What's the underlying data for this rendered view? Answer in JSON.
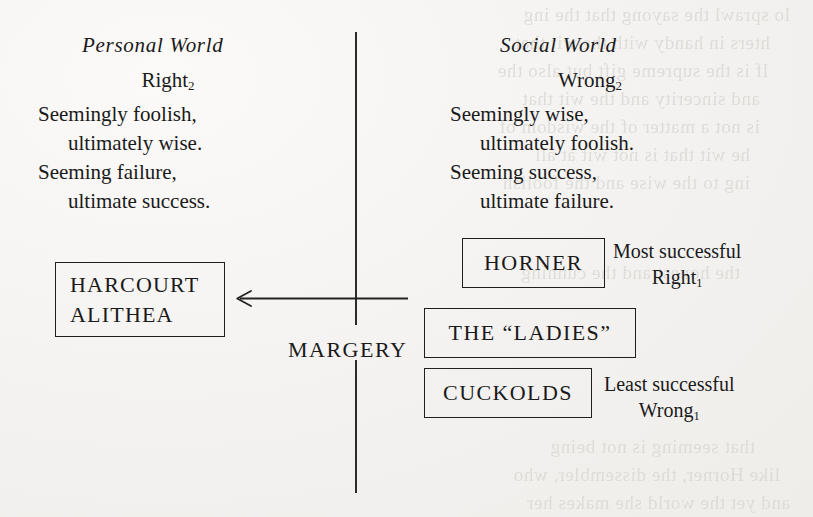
{
  "figure": {
    "background_color": "#f4f3f1",
    "ink_color": "#1f1f1f",
    "columns": {
      "left_heading": "Personal World",
      "right_heading": "Social World"
    },
    "left_stanza": {
      "label": "Right",
      "label_subscript": "2",
      "lines": [
        "Seemingly foolish,",
        "ultimately wise.",
        "Seeming failure,",
        "ultimate success."
      ]
    },
    "right_stanza": {
      "label": "Wrong",
      "label_subscript": "2",
      "lines": [
        "Seemingly wise,",
        "ultimately foolish.",
        "Seeming success,",
        "ultimate failure."
      ]
    },
    "boxes": [
      {
        "id": "harcourt-alithea",
        "line1": "HARCOURT",
        "line2": "ALITHEA"
      },
      {
        "id": "horner",
        "text": "HORNER"
      },
      {
        "id": "the-ladies",
        "text": "THE “LADIES”"
      },
      {
        "id": "cuckolds",
        "text": "CUCKOLDS"
      }
    ],
    "annotations": {
      "top_rank": "Most successful",
      "top_rank_label": "Right",
      "top_rank_subscript": "1",
      "bottom_rank": "Least successful",
      "bottom_rank_label": "Wrong",
      "bottom_rank_subscript": "1"
    },
    "axis_label": "MARGERY"
  },
  "ghost_text": {
    "lines": [
      "lo sprawl the sayong that the ing",
      "hters in handy with the wit that",
      "lf is the supreme gift but also the",
      "and sincerity and the wit that",
      "is not a matter of the wisdom of",
      "he wit that is not wit at all",
      "ing to the wise and the foolish",
      "the honest and the cunning",
      "that seeming is not being",
      "like Horner, the dissembler, who",
      "and yet the world she makes her"
    ]
  }
}
